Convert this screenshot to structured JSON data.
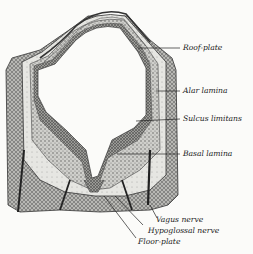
{
  "figure": {
    "background": "#fbfbf9",
    "ink": "#2a2a2a",
    "labels": [
      {
        "id": "roof-plate",
        "text": "Roof-plate"
      },
      {
        "id": "alar-lamina",
        "text": "Alar lamina"
      },
      {
        "id": "sulcus-limitans",
        "text": "Sulcus limitans"
      },
      {
        "id": "basal-lamina",
        "text": "Basal lamina"
      },
      {
        "id": "vagus-nerve",
        "text": "Vagus nerve"
      },
      {
        "id": "hypoglossal-nerve",
        "text": "Hypoglossal nerve"
      },
      {
        "id": "floor-plate",
        "text": "Floor-plate"
      }
    ]
  }
}
